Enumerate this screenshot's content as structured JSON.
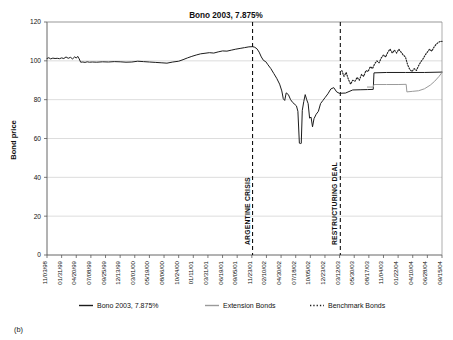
{
  "figure": {
    "caption": "(b)",
    "title": "Bono 2003, 7.875%"
  },
  "chart_data": {
    "type": "line",
    "title": "Bono 2003, 7.875%",
    "xlabel": "",
    "ylabel": "Bond price",
    "ylim": [
      0,
      120
    ],
    "yticks": [
      0,
      20,
      40,
      60,
      80,
      100,
      120
    ],
    "grid": "horizontal",
    "legend_position": "bottom",
    "x_tick_labels": [
      "11/03/98",
      "01/31/99",
      "04/20/99",
      "07/08/99",
      "09/25/99",
      "12/13/99",
      "03/01/00",
      "05/19/00",
      "08/06/00",
      "10/24/00",
      "01/11/01",
      "03/31/01",
      "06/19/01",
      "09/05/01",
      "11/23/01",
      "02/10/02",
      "04/30/02",
      "07/18/02",
      "10/05/02",
      "12/23/02",
      "03/12/03",
      "05/30/03",
      "08/17/03",
      "11/04/03",
      "01/22/04",
      "04/10/04",
      "06/28/04",
      "09/15/04"
    ],
    "annotations": [
      {
        "label": "ARGENTINE CRISIS",
        "x_index": 14.05,
        "style": "dashed-vertical"
      },
      {
        "label": "RESTRUCTURING DEAL",
        "x_index": 20.05,
        "style": "dashed-vertical"
      }
    ],
    "series": [
      {
        "name": "Bono 2003, 7.875%",
        "style": "solid",
        "color": "#1c1c1c",
        "x": [
          0,
          0.12,
          0.25,
          0.4,
          0.55,
          0.7,
          0.85,
          1,
          1.15,
          1.3,
          1.45,
          1.6,
          1.75,
          1.9,
          2.0,
          2.1,
          2.2,
          2.3,
          2.45,
          2.6,
          2.75,
          2.9,
          3.1,
          3.4,
          3.8,
          4.2,
          4.6,
          5.0,
          5.4,
          5.8,
          6.2,
          6.6,
          7.0,
          7.4,
          7.8,
          8.2,
          8.6,
          9.0,
          9.3,
          9.6,
          9.9,
          10.2,
          10.5,
          10.8,
          11.1,
          11.4,
          11.7,
          12.0,
          12.3,
          12.6,
          12.9,
          13.2,
          13.5,
          13.8,
          14.05,
          14.2,
          14.35,
          14.5,
          14.65,
          14.8,
          14.95,
          15.1,
          15.3,
          15.5,
          15.7,
          15.9,
          16.05,
          16.15,
          16.25,
          16.35,
          16.5,
          16.65,
          16.8,
          16.95,
          17.05,
          17.15,
          17.25,
          17.32,
          17.38,
          17.45,
          17.55,
          17.65,
          17.75,
          17.85,
          17.95,
          18.05,
          18.15,
          18.25,
          18.4,
          18.55,
          18.7,
          18.85,
          19.0,
          19.2,
          19.4,
          19.6,
          19.8,
          20.0,
          20.05,
          20.4,
          20.9,
          21.4,
          21.9,
          22.3,
          22.35,
          23.2,
          24.5,
          25.8,
          27.0
        ],
        "y": [
          101.2,
          101.6,
          101.0,
          101.4,
          101.2,
          101.3,
          101.1,
          101.5,
          101.2,
          102.0,
          101.3,
          101.8,
          101.0,
          102.1,
          101.4,
          102.3,
          101.0,
          99.3,
          99.4,
          99.2,
          99.5,
          99.3,
          99.4,
          99.3,
          99.5,
          99.4,
          99.6,
          99.5,
          99.3,
          99.4,
          99.8,
          99.6,
          99.4,
          99.2,
          99.0,
          98.8,
          99.4,
          99.8,
          100.6,
          101.5,
          102.3,
          103.0,
          103.6,
          103.9,
          104.2,
          104.0,
          104.6,
          105.1,
          105.0,
          105.5,
          106.0,
          106.4,
          106.8,
          107.2,
          107.3,
          107.0,
          106.2,
          104.5,
          102.0,
          100.2,
          99.6,
          98.0,
          96.0,
          93.5,
          91.0,
          88.0,
          84.5,
          80.5,
          79.6,
          83.5,
          82.6,
          80.0,
          78.5,
          77.5,
          76.8,
          74.0,
          57.6,
          57.4,
          57.5,
          74.5,
          79.0,
          82.6,
          80.0,
          78.0,
          70.5,
          71.0,
          66.0,
          70.2,
          72.5,
          74.0,
          78.0,
          79.5,
          81.0,
          83.0,
          85.5,
          86.2,
          84.0,
          83.2,
          83.3,
          83.4,
          85.0,
          85.1,
          85.2,
          85.3,
          93.8,
          94.0,
          94.0,
          94.0,
          94.2
        ]
      },
      {
        "name": "Extension Bonds",
        "style": "solid",
        "color": "#9a9a9a",
        "x": [
          21.9,
          22.3,
          22.35,
          23.2,
          24.0,
          24.55,
          24.6,
          25.0,
          25.4,
          25.8,
          26.2,
          26.5,
          26.8,
          27.0
        ],
        "y": [
          86.5,
          86.5,
          87.8,
          87.8,
          87.8,
          87.9,
          84.0,
          84.3,
          84.6,
          85.6,
          87.5,
          89.5,
          92.0,
          94.0
        ]
      },
      {
        "name": "Benchmark Bonds",
        "style": "dotted",
        "color": "#1c1c1c",
        "x": [
          20.15,
          20.3,
          20.45,
          20.6,
          20.75,
          20.9,
          21.05,
          21.2,
          21.35,
          21.5,
          21.65,
          21.8,
          21.95,
          22.1,
          22.25,
          22.4,
          22.55,
          22.7,
          22.85,
          23.0,
          23.15,
          23.3,
          23.45,
          23.6,
          23.75,
          23.9,
          24.05,
          24.2,
          24.35,
          24.5,
          24.65,
          24.8,
          24.95,
          25.1,
          25.25,
          25.4,
          25.55,
          25.7,
          25.85,
          26.0,
          26.15,
          26.3,
          26.45,
          26.6,
          26.75,
          26.9,
          27.0
        ],
        "y": [
          95.0,
          92.0,
          94.0,
          90.5,
          88.0,
          90.0,
          89.5,
          91.5,
          90.0,
          93.0,
          92.0,
          95.0,
          94.5,
          97.0,
          96.0,
          98.5,
          100.0,
          99.0,
          101.5,
          103.0,
          102.0,
          104.5,
          106.0,
          104.0,
          105.5,
          104.0,
          106.0,
          104.5,
          103.0,
          102.0,
          98.0,
          95.5,
          94.5,
          96.0,
          95.0,
          97.5,
          99.5,
          101.0,
          103.0,
          104.5,
          106.0,
          105.0,
          107.0,
          108.5,
          109.5,
          110.0,
          110.0
        ]
      }
    ],
    "legend": [
      {
        "label": "Bono 2003, 7.875%",
        "style": "solid",
        "color": "#1c1c1c"
      },
      {
        "label": "Extension Bonds",
        "style": "solid",
        "color": "#9a9a9a"
      },
      {
        "label": "Benchmark Bonds",
        "style": "dotted",
        "color": "#1c1c1c"
      }
    ]
  }
}
